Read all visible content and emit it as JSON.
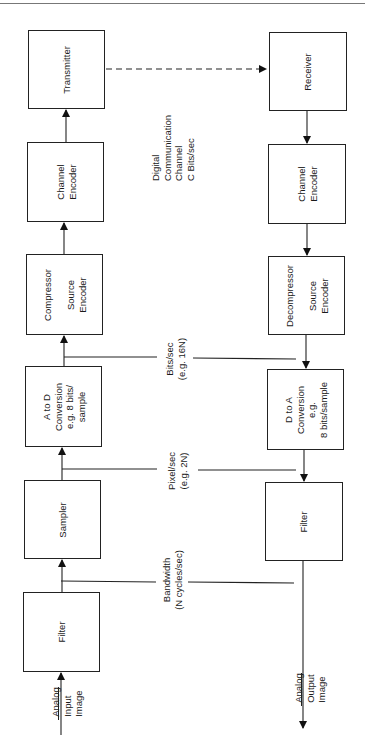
{
  "diagram": {
    "title": "",
    "transmit_chain": [
      {
        "id": "filter_in",
        "label": "Filter"
      },
      {
        "id": "sampler",
        "label": "Sampler"
      },
      {
        "id": "a_to_d",
        "label": "A to D\nConversion\ne.g. 8 bits/\nsample"
      },
      {
        "id": "compressor",
        "label": "Compressor\n\nSource\nEncoder"
      },
      {
        "id": "channel_encoder_tx",
        "label": "Channel\nEncoder"
      },
      {
        "id": "transmitter",
        "label": "Transmitter"
      }
    ],
    "receive_chain": [
      {
        "id": "receiver",
        "label": "Receiver"
      },
      {
        "id": "channel_encoder_rx",
        "label": "Channel\nEncoder"
      },
      {
        "id": "decompressor",
        "label": "Decompressor\n\nSource\nEncoder"
      },
      {
        "id": "d_to_a",
        "label": "D to A\nConversion\ne.g.\n8 bits/sample"
      },
      {
        "id": "filter_out",
        "label": "Filter"
      }
    ],
    "annotations": {
      "channel": "Digital\nCommunication\nChannel\nC Bits/sec",
      "bits": "Bits/sec\n(e.g. 16N)",
      "pixels": "Pixel/sec\n(e.g. 2N)",
      "bandwidth": "Bandwidth\n(N cycles/sec)",
      "input": "Analog\nInput\nImage",
      "output": "Analog\nOutput\nImage"
    },
    "input_underline_word": "Analog",
    "output_underline_word": "Analog"
  }
}
